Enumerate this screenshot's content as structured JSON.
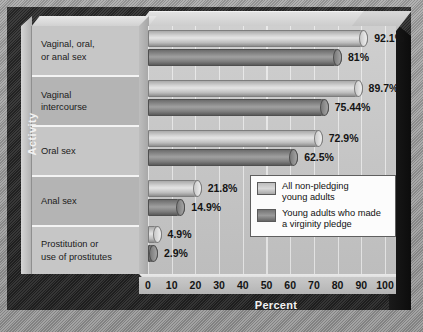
{
  "chart_data": {
    "type": "bar",
    "orientation": "horizontal",
    "title": "",
    "xlabel": "Percent",
    "ylabel": "Activity",
    "xlim": [
      0,
      100
    ],
    "xticks": [
      "0",
      "10",
      "20",
      "30",
      "40",
      "50",
      "60",
      "70",
      "80",
      "90",
      "100"
    ],
    "grid": true,
    "legend_position": "inside-lower-right",
    "categories": [
      "Vaginal, oral, or anal sex",
      "Vaginal intercourse",
      "Oral sex",
      "Anal sex",
      "Prostitution or use of prostitutes"
    ],
    "category_lines": [
      [
        "Vaginal, oral,",
        "or anal sex"
      ],
      [
        "Vaginal",
        "intercourse"
      ],
      [
        "Oral sex"
      ],
      [
        "Anal sex"
      ],
      [
        "Prostitution or",
        "use of prostitutes"
      ]
    ],
    "series": [
      {
        "name": "All non-pledging young adults",
        "name_lines": [
          "All non-pledging",
          "young adults"
        ],
        "color": "#d3d3d3",
        "values": [
          92.1,
          89.7,
          72.9,
          21.8,
          4.9
        ],
        "labels": [
          "92.1%",
          "89.7%",
          "72.9%",
          "21.8%",
          "4.9%"
        ]
      },
      {
        "name": "Young adults who made a virginity pledge",
        "name_lines": [
          "Young adults who made",
          "a virginity pledge"
        ],
        "color": "#8e8e8e",
        "values": [
          81,
          75.44,
          62.5,
          14.9,
          2.9
        ],
        "labels": [
          "81%",
          "75.44%",
          "62.5%",
          "14.9%",
          "2.9%"
        ]
      }
    ]
  }
}
